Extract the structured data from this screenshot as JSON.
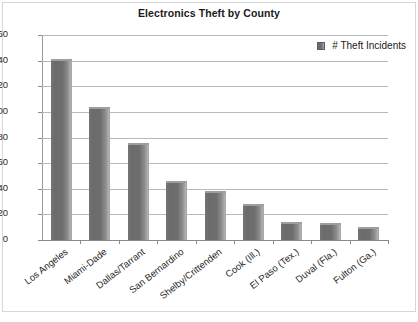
{
  "chart_data": {
    "type": "bar",
    "title": "Electronics Theft by County",
    "xlabel": "",
    "ylabel": "",
    "ylim": [
      0,
      160
    ],
    "ytick_step": 20,
    "yticks": [
      160,
      140,
      120,
      100,
      80,
      60,
      40,
      20,
      0
    ],
    "grid": true,
    "legend_position": "top-right",
    "legend": [
      "# Theft Incidents"
    ],
    "series_name": "# Theft Incidents",
    "bar_color": "#6e6e6e",
    "categories": [
      "Los Angeles",
      "Miami-Dade",
      "Dallas/Tarrant",
      "San Bernardino",
      "Shelby/Crittenden",
      "Cook (Ill.)",
      "El Paso (Tex.)",
      "Duval (Fla.)",
      "Fulton (Ga.)"
    ],
    "values": [
      141,
      104,
      76,
      46,
      38,
      28,
      14,
      13,
      10
    ]
  }
}
